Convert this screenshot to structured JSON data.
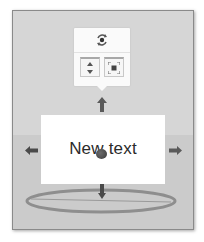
{
  "scene": {
    "wall_color": "#d6d6d6",
    "floor_color": "#cbcbcb",
    "text_object": {
      "label": "New text"
    }
  },
  "popup_toolbar": {
    "top_icon": "rotate-orbit-icon",
    "buttons": [
      {
        "icon": "move-vertical-icon",
        "tooltip": ""
      },
      {
        "icon": "focus-frame-icon",
        "tooltip": ""
      }
    ]
  },
  "gizmo": {
    "arrows": [
      "up",
      "down",
      "left",
      "right"
    ],
    "ring": "rotation-ring",
    "handle_color": "#4a4a4a",
    "ring_color": "#8e8e8e"
  }
}
